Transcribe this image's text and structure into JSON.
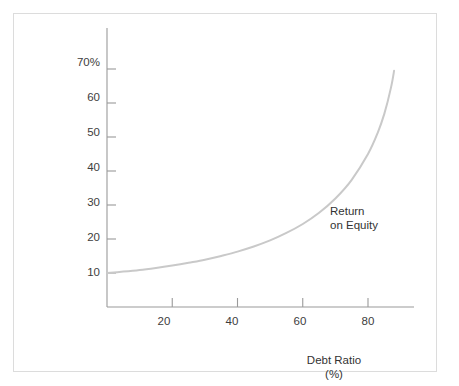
{
  "figure": {
    "background_color": "#ffffff",
    "border_color": "#dcdcdc",
    "ghost_text": "",
    "frame_name": "chart-frame"
  },
  "chart_data": {
    "type": "line",
    "title": "",
    "subtitle": "",
    "xlabel": "Debt Ratio",
    "xlabel_units": "(%)",
    "ylabel": "",
    "xlim": [
      0,
      92
    ],
    "ylim": [
      0,
      80
    ],
    "grid": false,
    "legend_position": "inline-annotation",
    "line_color": "#c9c9c9",
    "axis_color": "#9a9a9a",
    "text_color": "#333333",
    "x_ticks": [
      20,
      40,
      60,
      80
    ],
    "x_tick_labels": [
      "20",
      "40",
      "60",
      "80"
    ],
    "y_ticks": [
      10,
      20,
      30,
      40,
      50,
      60,
      70
    ],
    "y_tick_labels": [
      "10",
      "20",
      "30",
      "40",
      "50",
      "60",
      "70%"
    ],
    "annotations": [
      {
        "name": "return-on-equity-label",
        "line1": "Return",
        "line2": "on Equity",
        "x": 68,
        "y": 31
      }
    ],
    "series": [
      {
        "name": "Return on Equity",
        "x": [
          0,
          5,
          10,
          15,
          20,
          25,
          30,
          35,
          40,
          45,
          50,
          55,
          60,
          65,
          70,
          75,
          80,
          83,
          85,
          87,
          88
        ],
        "values": [
          10.0,
          10.4,
          10.9,
          11.5,
          12.2,
          13.0,
          13.9,
          15.0,
          16.3,
          17.8,
          19.6,
          21.8,
          24.4,
          27.7,
          31.9,
          37.4,
          45.0,
          51.3,
          56.8,
          64.3,
          69.5
        ],
        "x_label": "Debt Ratio (%)",
        "y_label": "Return on Equity (%)"
      }
    ]
  }
}
